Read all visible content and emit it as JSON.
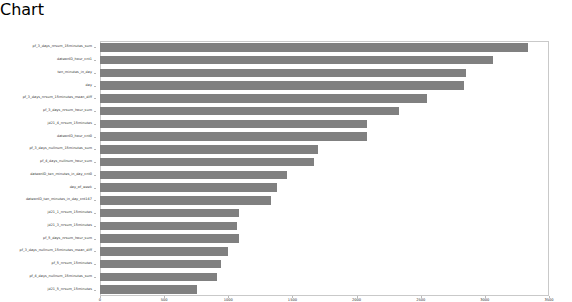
{
  "chart_data": {
    "type": "bar",
    "orientation": "horizontal",
    "title": "",
    "xlabel": "",
    "ylabel": "",
    "grid": false,
    "legend": null,
    "bar_color": "#808080",
    "frame_color": "#c9c9c9",
    "xlim": [
      0,
      3500
    ],
    "xticks": [
      0,
      500,
      1000,
      1500,
      2000,
      2500,
      3000,
      3500
    ],
    "xticklabels": [
      "0",
      "500",
      "1000",
      "1500",
      "2000",
      "2500",
      "3000",
      "3500"
    ],
    "categories": [
      "pf_3_days_nrsum_15minutes_sum",
      "dateonID_hour_cnt1",
      "ten_minutes_in_day",
      "day",
      "pf_3_days_nrsum_15minutes_mean_diff",
      "pf_3_days_nrsum_hour_sum",
      "jd21_4_nrsum_15minutes",
      "dateonID_hour_cnt0",
      "pf_3_days_nullnum_15minutes_sum",
      "pf_4_days_nullnum_hour_sum",
      "dateonID_ten_minutes_in_day_cnt0",
      "day_of_week",
      "dateonID_ten_minutes_in_day_cnt147",
      "jd21_1_nrsum_15minutes",
      "jd21_3_nrsum_15minutes",
      "pf_5_days_nrsum_hour_sum",
      "pf_3_days_nullnum_15minutes_mean_diff",
      "pf_5_nrsum_15minutes",
      "pf_4_days_nullnum_15minutes_sum",
      "jd21_5_nrsum_15minutes"
    ],
    "values": [
      3340,
      3060,
      2850,
      2840,
      2550,
      2330,
      2080,
      2080,
      1700,
      1670,
      1460,
      1380,
      1330,
      1080,
      1070,
      1080,
      1000,
      940,
      910,
      760
    ]
  }
}
